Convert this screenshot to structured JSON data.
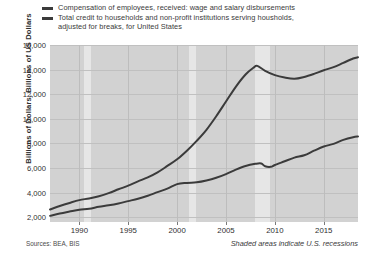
{
  "legend": {
    "entries": [
      {
        "label": "Compensation of employees, received: wage and salary disbursements",
        "color": "#3b3b3b"
      },
      {
        "label": "Total credit to households and non-profit institutions serving housholds,\nadjusted for breaks, for United States",
        "color": "#3b3b3b"
      }
    ]
  },
  "axis": {
    "ylabel": "Billions of Dollars, Billions of US Dollars",
    "yticks": [
      "2,000",
      "4,000",
      "6,000",
      "8,000",
      "10,000",
      "12,000",
      "14,000",
      "16,000"
    ],
    "xticks": [
      "1990",
      "1995",
      "2000",
      "2005",
      "2010",
      "2015"
    ]
  },
  "footer": {
    "sources": "Sources: BEA, BIS",
    "shaded_note": "Shaded areas indicate U.S. recessions"
  },
  "chart_data": {
    "type": "line",
    "title": "",
    "xlabel": "",
    "ylabel": "Billions of Dollars, Billions of US Dollars",
    "xlim": [
      1987.0,
      2018.5
    ],
    "ylim": [
      1600,
      16000
    ],
    "grid": true,
    "legend_position": "top",
    "xticks": [
      1990,
      1995,
      2000,
      2005,
      2010,
      2015
    ],
    "yticks": [
      2000,
      4000,
      6000,
      8000,
      10000,
      12000,
      14000,
      16000
    ],
    "recessions": [
      {
        "start": 1990.5,
        "end": 1991.2
      },
      {
        "start": 2001.2,
        "end": 2001.9
      },
      {
        "start": 2007.95,
        "end": 2009.5
      }
    ],
    "recession_color": "#e6e6e6",
    "plot_background": "#d2d2d2",
    "series": [
      {
        "name": "Compensation of employees, received: wage and salary disbursements",
        "color": "#3b3b3b",
        "x": [
          1987.0,
          1988.0,
          1989.0,
          1990.0,
          1991.0,
          1992.0,
          1993.0,
          1994.0,
          1995.0,
          1996.0,
          1997.0,
          1998.0,
          1999.0,
          2000.0,
          2001.0,
          2002.0,
          2003.0,
          2004.0,
          2005.0,
          2006.0,
          2007.0,
          2008.0,
          2008.6,
          2009.0,
          2009.6,
          2010.0,
          2011.0,
          2012.0,
          2013.0,
          2014.0,
          2015.0,
          2016.0,
          2017.0,
          2018.0,
          2018.5
        ],
        "y": [
          2100,
          2290,
          2450,
          2600,
          2680,
          2840,
          2960,
          3110,
          3300,
          3490,
          3740,
          4030,
          4310,
          4680,
          4780,
          4830,
          4980,
          5200,
          5500,
          5860,
          6160,
          6330,
          6360,
          6130,
          6090,
          6240,
          6540,
          6840,
          7030,
          7400,
          7740,
          7960,
          8280,
          8500,
          8560
        ]
      },
      {
        "name": "Total credit to households and non-profit institutions serving housholds, adjusted for breaks, for United States",
        "color": "#3b3b3b",
        "x": [
          1987.0,
          1988.0,
          1989.0,
          1990.0,
          1991.0,
          1992.0,
          1993.0,
          1994.0,
          1995.0,
          1996.0,
          1997.0,
          1998.0,
          1999.0,
          2000.0,
          2001.0,
          2002.0,
          2003.0,
          2004.0,
          2005.0,
          2006.0,
          2007.0,
          2007.8,
          2008.2,
          2009.0,
          2010.0,
          2011.0,
          2012.0,
          2013.0,
          2014.0,
          2015.0,
          2016.0,
          2017.0,
          2018.0,
          2018.5
        ],
        "y": [
          2620,
          2900,
          3150,
          3380,
          3520,
          3700,
          3950,
          4260,
          4560,
          4900,
          5230,
          5640,
          6160,
          6700,
          7400,
          8200,
          9100,
          10200,
          11400,
          12600,
          13600,
          14150,
          14300,
          13900,
          13550,
          13350,
          13250,
          13400,
          13650,
          13950,
          14200,
          14550,
          14900,
          15000
        ]
      }
    ]
  }
}
